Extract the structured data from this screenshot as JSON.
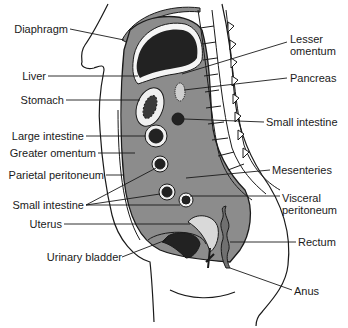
{
  "figure": {
    "colors": {
      "outline": "#1a1a1a",
      "cavity_fill": "#8c8c8c",
      "organ_dark": "#222222",
      "peritoneum_light": "#d9d9d9",
      "background": "#ffffff"
    },
    "labels_left": [
      {
        "id": "diaphragm",
        "text": "Diaphragm"
      },
      {
        "id": "liver",
        "text": "Liver"
      },
      {
        "id": "stomach",
        "text": "Stomach"
      },
      {
        "id": "large-intestine",
        "text": "Large intestine"
      },
      {
        "id": "greater-omentum",
        "text": "Greater omentum"
      },
      {
        "id": "parietal-peritoneum",
        "text": "Parietal peritoneum"
      },
      {
        "id": "small-intestine-left",
        "text": "Small intestine"
      },
      {
        "id": "uterus",
        "text": "Uterus"
      },
      {
        "id": "urinary-bladder",
        "text": "Urinary bladder"
      }
    ],
    "labels_right": [
      {
        "id": "lesser-omentum",
        "text": "Lesser\nomentum"
      },
      {
        "id": "pancreas",
        "text": "Pancreas"
      },
      {
        "id": "small-intestine-right",
        "text": "Small intestine"
      },
      {
        "id": "mesenteries",
        "text": "Mesenteries"
      },
      {
        "id": "visceral-peritoneum",
        "text": "Visceral\nperitoneum"
      },
      {
        "id": "rectum",
        "text": "Rectum"
      },
      {
        "id": "anus",
        "text": "Anus"
      }
    ]
  }
}
